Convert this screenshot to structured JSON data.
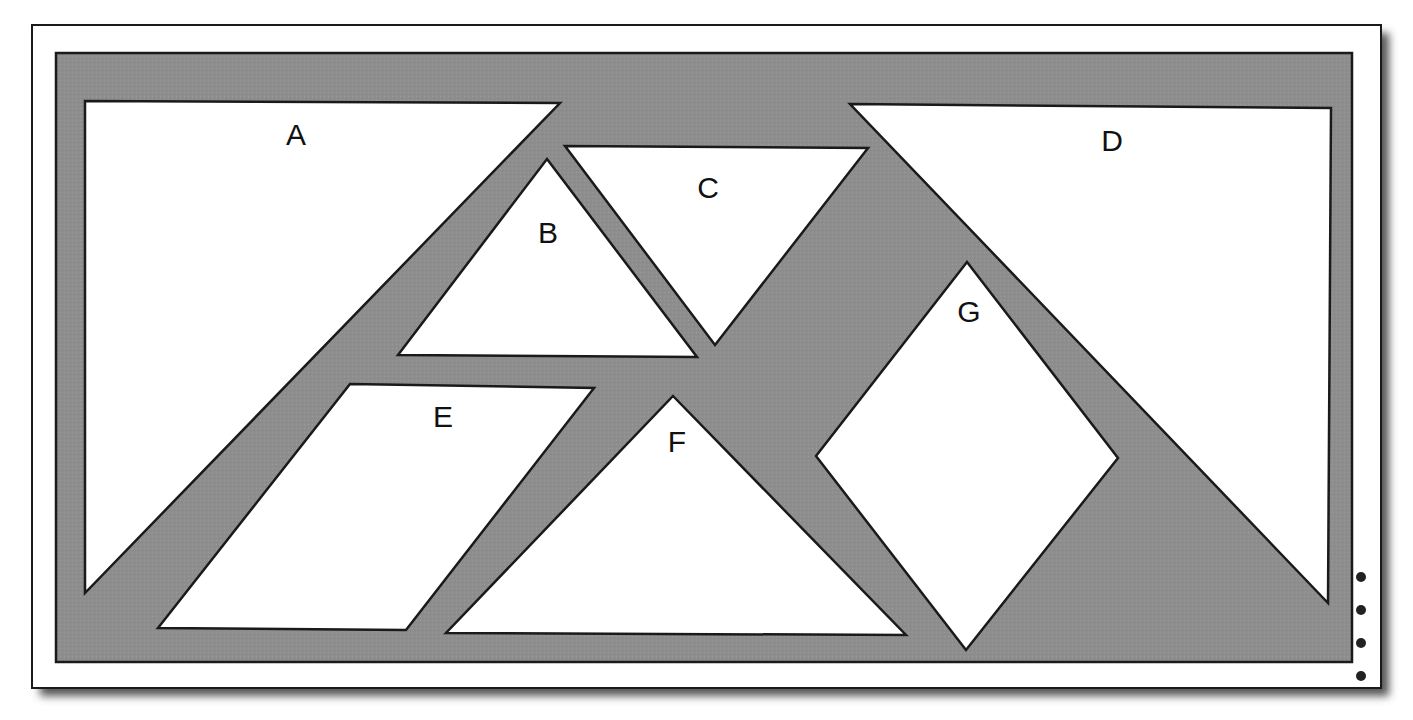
{
  "diagram": {
    "type": "tangram-puzzle",
    "colors": {
      "background": "#ffffff",
      "paper": "#ffffff",
      "panel": "#8e8e8e",
      "piece": "#ffffff",
      "stroke": "#1a1a1a",
      "shadow": "#555555",
      "dot": "#222222"
    },
    "frame": {
      "paper": {
        "x": 32,
        "y": 25,
        "w": 1349,
        "h": 663
      },
      "panel": {
        "x": 56,
        "y": 53,
        "w": 1296,
        "h": 609
      }
    },
    "pieces": [
      {
        "id": "A",
        "label": "A",
        "points": "85,101 560,103 85,593",
        "label_x": 296,
        "label_y": 145
      },
      {
        "id": "B",
        "label": "B",
        "points": "547,159 697,357 398,355",
        "label_x": 548,
        "label_y": 243
      },
      {
        "id": "C",
        "label": "C",
        "points": "565,146 868,148 715,345",
        "label_x": 708,
        "label_y": 198
      },
      {
        "id": "D",
        "label": "D",
        "points": "850,104 1331,108 1328,603",
        "label_x": 1112,
        "label_y": 151
      },
      {
        "id": "E",
        "label": "E",
        "points": "350,384 594,388 406,630 158,628",
        "label_x": 443,
        "label_y": 427
      },
      {
        "id": "F",
        "label": "F",
        "points": "673,396 906,635 446,633",
        "label_x": 677,
        "label_y": 452
      },
      {
        "id": "G",
        "label": "G",
        "points": "967,262 1118,458 966,650 816,456",
        "label_x": 969,
        "label_y": 322
      }
    ],
    "perforation_dots": [
      {
        "cx": 1361,
        "cy": 577
      },
      {
        "cx": 1361,
        "cy": 610
      },
      {
        "cx": 1361,
        "cy": 643
      },
      {
        "cx": 1361,
        "cy": 676
      }
    ]
  }
}
